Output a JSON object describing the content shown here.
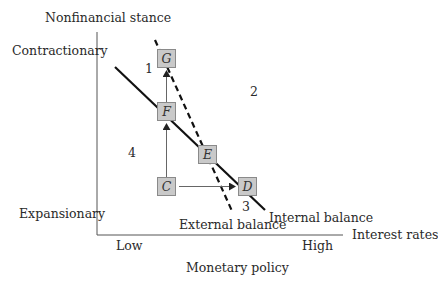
{
  "diagram": {
    "y_axis": {
      "title": "Nonfinancial stance",
      "top_label": "Contractionary",
      "bottom_label": "Expansionary"
    },
    "x_axis": {
      "end_label": "Interest rates",
      "left_label": "Low",
      "right_label": "High",
      "title": "Monetary policy"
    },
    "curves": {
      "internal": {
        "label": "Internal balance",
        "style": "solid"
      },
      "external": {
        "label": "External balance",
        "style": "dashed"
      }
    },
    "points": {
      "G": "G",
      "F": "F",
      "E": "E",
      "C": "C",
      "D": "D"
    },
    "regions": {
      "r1": "1",
      "r2": "2",
      "r3": "3",
      "r4": "4"
    },
    "arrows": [
      {
        "from": "C",
        "to": "F"
      },
      {
        "from": "F",
        "to": "G"
      },
      {
        "from": "C",
        "to": "D"
      }
    ],
    "colors": {
      "line": "#111111",
      "axis": "#555555",
      "box_fill": "#c9c9c9",
      "box_border": "#8a8a8a",
      "arrow": "#666666"
    }
  }
}
